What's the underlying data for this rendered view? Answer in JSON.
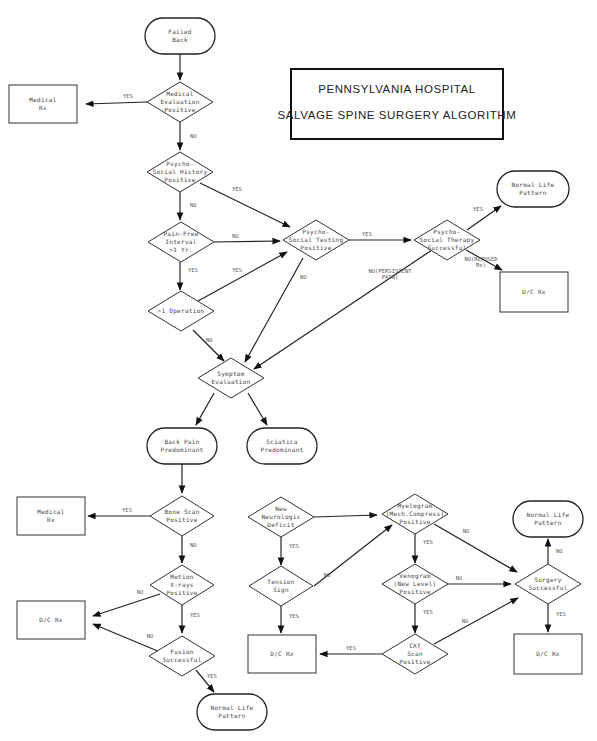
{
  "title": {
    "line1": "PENNSYLVANIA HOSPITAL",
    "line2": "SALVAGE SPINE SURGERY ALGORITHM"
  },
  "nodes": {
    "failed_back": {
      "type": "terminal",
      "lines": [
        "Failed",
        "Back"
      ]
    },
    "medical_eval": {
      "type": "decision",
      "lines": [
        "Medical",
        "Evaluation",
        "Positive"
      ]
    },
    "medical_rx_1": {
      "type": "process",
      "lines": [
        "Medical",
        "Rx"
      ]
    },
    "psychosocial_history": {
      "type": "decision",
      "lines": [
        "Psycho-",
        "Social History",
        "Positive"
      ]
    },
    "pain_free": {
      "type": "decision",
      "lines": [
        "Pain-Free",
        "Interval",
        ">1 Yr."
      ]
    },
    "psychosocial_testing": {
      "type": "decision",
      "lines": [
        "Psycho-",
        "Social Testing",
        "Positive"
      ]
    },
    "psychosocial_therapy": {
      "type": "decision",
      "lines": [
        "Psycho-",
        "Social Therapy",
        "Successful"
      ]
    },
    "normal_life_1": {
      "type": "terminal",
      "lines": [
        "Normal Life",
        "Pattern"
      ]
    },
    "dc_rx_1": {
      "type": "process",
      "lines": [
        "D/C Rx"
      ]
    },
    "gt1_operation": {
      "type": "decision",
      "lines": [
        ">1 Operation"
      ]
    },
    "symptom_eval": {
      "type": "decision",
      "lines": [
        "Symptom",
        "Evaluation"
      ]
    },
    "back_pain": {
      "type": "terminal",
      "lines": [
        "Back Pain",
        "Predominant"
      ]
    },
    "sciatica": {
      "type": "terminal",
      "lines": [
        "Sciatica",
        "Predominant"
      ]
    },
    "bone_scan": {
      "type": "decision",
      "lines": [
        "Bone Scan",
        "Positive"
      ]
    },
    "medical_rx_2": {
      "type": "process",
      "lines": [
        "Medical",
        "Rx"
      ]
    },
    "motion_xrays": {
      "type": "decision",
      "lines": [
        "Motion",
        "X-rays",
        "Positive"
      ]
    },
    "dc_rx_2": {
      "type": "process",
      "lines": [
        "D/C Rx"
      ]
    },
    "fusion": {
      "type": "decision",
      "lines": [
        "Fusion",
        "Successful"
      ]
    },
    "normal_life_2": {
      "type": "terminal",
      "lines": [
        "Normal Life",
        "Pattern"
      ]
    },
    "new_neuro": {
      "type": "decision",
      "lines": [
        "New",
        "Neurologic",
        "Deficit"
      ]
    },
    "tension_sign": {
      "type": "decision",
      "lines": [
        "Tension",
        "Sign"
      ]
    },
    "dc_rx_3": {
      "type": "process",
      "lines": [
        "D/C Rx"
      ]
    },
    "myelogram": {
      "type": "decision",
      "lines": [
        "Myelogram",
        "(Mech.Compress)",
        "Positive"
      ]
    },
    "venogram": {
      "type": "decision",
      "lines": [
        "Venogram",
        "(New Level)",
        "Positive"
      ]
    },
    "cat_scan": {
      "type": "decision",
      "lines": [
        "CAT",
        "Scan",
        "Positive"
      ]
    },
    "surgery": {
      "type": "decision",
      "lines": [
        "Surgery",
        "Successful"
      ]
    },
    "normal_life_3": {
      "type": "terminal",
      "lines": [
        "Normal Life",
        "Pattern"
      ]
    },
    "dc_rx_4": {
      "type": "process",
      "lines": [
        "D/C Rx"
      ]
    }
  },
  "edges": [
    {
      "from": "failed_back",
      "to": "medical_eval",
      "label": ""
    },
    {
      "from": "medical_eval",
      "to": "medical_rx_1",
      "label": "YES"
    },
    {
      "from": "medical_eval",
      "to": "psychosocial_history",
      "label": "NO"
    },
    {
      "from": "psychosocial_history",
      "to": "psychosocial_testing",
      "label": "YES"
    },
    {
      "from": "psychosocial_history",
      "to": "pain_free",
      "label": "NO"
    },
    {
      "from": "pain_free",
      "to": "psychosocial_testing",
      "label": "NO"
    },
    {
      "from": "pain_free",
      "to": "gt1_operation",
      "label": "YES"
    },
    {
      "from": "gt1_operation",
      "to": "psychosocial_testing",
      "label": "YES"
    },
    {
      "from": "gt1_operation",
      "to": "symptom_eval",
      "label": "NO"
    },
    {
      "from": "psychosocial_testing",
      "to": "psychosocial_therapy",
      "label": "YES"
    },
    {
      "from": "psychosocial_testing",
      "to": "symptom_eval",
      "label": "NO"
    },
    {
      "from": "psychosocial_therapy",
      "to": "normal_life_1",
      "label": "YES"
    },
    {
      "from": "psychosocial_therapy",
      "to": "dc_rx_1",
      "label": "NO(REFUSED Rx)"
    },
    {
      "from": "psychosocial_therapy",
      "to": "symptom_eval",
      "label": "NO(PERSISTENT PAIN)"
    },
    {
      "from": "symptom_eval",
      "to": "back_pain",
      "label": ""
    },
    {
      "from": "symptom_eval",
      "to": "sciatica",
      "label": ""
    },
    {
      "from": "back_pain",
      "to": "bone_scan",
      "label": ""
    },
    {
      "from": "bone_scan",
      "to": "medical_rx_2",
      "label": "YES"
    },
    {
      "from": "bone_scan",
      "to": "motion_xrays",
      "label": "NO"
    },
    {
      "from": "motion_xrays",
      "to": "dc_rx_2",
      "label": "NO"
    },
    {
      "from": "motion_xrays",
      "to": "fusion",
      "label": "YES"
    },
    {
      "from": "fusion",
      "to": "dc_rx_2",
      "label": "NO"
    },
    {
      "from": "fusion",
      "to": "normal_life_2",
      "label": "YES"
    },
    {
      "from": "sciatica",
      "to": "new_neuro",
      "label": ""
    },
    {
      "from": "new_neuro",
      "to": "myelogram",
      "label": "YES"
    },
    {
      "from": "new_neuro",
      "to": "tension_sign",
      "label": "NO"
    },
    {
      "from": "tension_sign",
      "to": "myelogram",
      "label": "YES"
    },
    {
      "from": "tension_sign",
      "to": "dc_rx_3",
      "label": "NO"
    },
    {
      "from": "myelogram",
      "to": "surgery",
      "label": "YES"
    },
    {
      "from": "myelogram",
      "to": "venogram",
      "label": "NO"
    },
    {
      "from": "venogram",
      "to": "surgery",
      "label": "YES"
    },
    {
      "from": "venogram",
      "to": "cat_scan",
      "label": "NO"
    },
    {
      "from": "cat_scan",
      "to": "surgery",
      "label": "YES"
    },
    {
      "from": "cat_scan",
      "to": "dc_rx_3",
      "label": "NO"
    },
    {
      "from": "surgery",
      "to": "normal_life_3",
      "label": "YES"
    },
    {
      "from": "surgery",
      "to": "dc_rx_4",
      "label": "NO"
    }
  ]
}
